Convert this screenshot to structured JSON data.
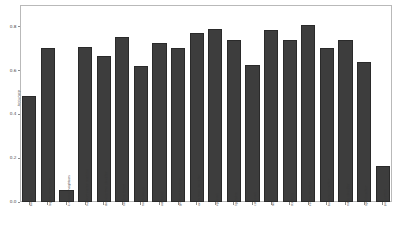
{
  "chart_data": {
    "type": "bar",
    "title": "",
    "xlabel": "",
    "ylabel": "Accuracy",
    "ylim": [
      0.0,
      0.9
    ],
    "yticks": [
      "0.0",
      "0.2",
      "0.4",
      "0.6",
      "0.8"
    ],
    "ytick_values": [
      0.0,
      0.2,
      0.4,
      0.6,
      0.8
    ],
    "grid": false,
    "legend": "none",
    "bar_color": "#3d3d3d",
    "categories": [
      "baseline",
      "logistic regression",
      "k-nearest neighbors",
      "support vector machine",
      "decision tree classifier",
      "random forest",
      "naive bayes",
      "adaboost",
      "gradient boosting",
      "extra trees classifier",
      "xgboost",
      "lightgbm",
      "catboost",
      "mlp",
      "stacking",
      "voting classifier",
      "bagging classifier",
      "ridge classifier",
      "sgd classifier",
      "perceptron"
    ],
    "values": [
      0.485,
      0.705,
      0.055,
      0.71,
      0.665,
      0.755,
      0.62,
      0.725,
      0.705,
      0.77,
      0.79,
      0.74,
      0.625,
      0.785,
      0.74,
      0.81,
      0.705,
      0.74,
      0.64,
      0.165
    ]
  }
}
